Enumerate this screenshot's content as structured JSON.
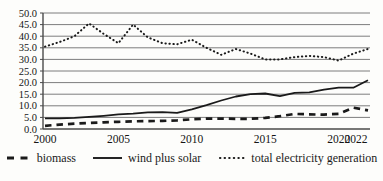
{
  "chart_data": {
    "type": "line",
    "title": "",
    "xlabel": "",
    "ylabel": "",
    "x": [
      2000,
      2001,
      2002,
      2003,
      2004,
      2005,
      2006,
      2007,
      2008,
      2009,
      2010,
      2011,
      2012,
      2013,
      2014,
      2015,
      2016,
      2017,
      2018,
      2019,
      2020,
      2021,
      2022
    ],
    "series": [
      {
        "name": "biomass",
        "line_style": "dashed",
        "values": [
          1.4,
          1.9,
          2.3,
          2.6,
          2.9,
          3.1,
          3.3,
          3.4,
          3.5,
          3.7,
          4.2,
          4.5,
          4.5,
          4.4,
          4.4,
          4.8,
          5.5,
          6.5,
          6.3,
          6.2,
          6.5,
          9.2,
          8.0
        ]
      },
      {
        "name": "wind plus solar",
        "line_style": "solid",
        "values": [
          4.6,
          4.6,
          4.8,
          5.2,
          5.7,
          6.3,
          6.6,
          7.2,
          7.3,
          7.0,
          8.5,
          10.3,
          12.3,
          14.0,
          15.0,
          15.3,
          14.2,
          15.6,
          15.8,
          17.0,
          17.8,
          17.8,
          21.0
        ]
      },
      {
        "name": "total electricity generation",
        "line_style": "dotted",
        "values": [
          35.5,
          37.5,
          40.0,
          45.5,
          41.0,
          37.0,
          45.0,
          39.5,
          37.0,
          36.5,
          38.5,
          35.0,
          32.0,
          34.5,
          32.5,
          30.0,
          30.0,
          31.0,
          31.5,
          31.0,
          29.5,
          32.5,
          34.5
        ]
      }
    ],
    "ylim": [
      0,
      50
    ],
    "y_tick_step": 5,
    "y_tick_labels": [
      "0.0",
      "5.0",
      "10.0",
      "15.0",
      "20.0",
      "25.0",
      "30.0",
      "35.0",
      "40.0",
      "45.0",
      "50.0"
    ],
    "x_ticks": [
      2000,
      2005,
      2010,
      2015,
      2020,
      2022
    ],
    "x_tick_labels": [
      "2000",
      "2005",
      "2010",
      "2015",
      "2020",
      "2022"
    ],
    "grid": true,
    "legend_position": "bottom",
    "line_color": "#1a1a1a",
    "grid_color": "#7d7d7d",
    "axis_color": "#4a4a4a"
  }
}
